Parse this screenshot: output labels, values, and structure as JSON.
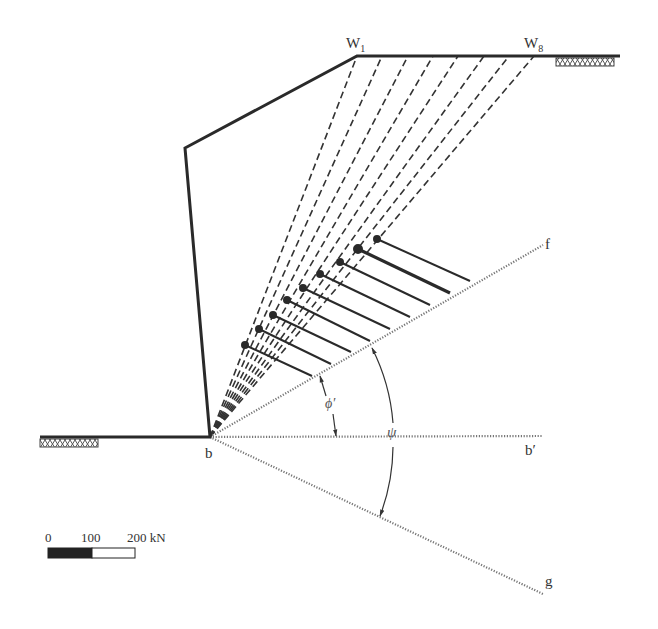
{
  "labels": {
    "w1": "W",
    "w1_sub": "1",
    "w8": "W",
    "w8_sub": "8",
    "b": "b",
    "b_prime": "b′",
    "f": "f",
    "g": "g",
    "phi": "ϕ′",
    "psi": "ψ"
  },
  "scale_bar": {
    "ticks": [
      "0",
      "100",
      "200 kN"
    ]
  },
  "colors": {
    "line": "#2a2a2a",
    "dotted": "#777777"
  },
  "geometry": {
    "toe_b": [
      210,
      437
    ],
    "crest_w1": [
      357,
      56
    ],
    "w8": [
      534,
      56
    ],
    "wall_top": [
      185,
      148
    ],
    "force_vectors": [
      {
        "start": [
          245,
          345
        ],
        "end": [
          312,
          376
        ]
      },
      {
        "start": [
          259,
          329
        ],
        "end": [
          331,
          364
        ]
      },
      {
        "start": [
          273,
          315
        ],
        "end": [
          351,
          352
        ]
      },
      {
        "start": [
          287,
          300
        ],
        "end": [
          370,
          341
        ]
      },
      {
        "start": [
          303,
          288
        ],
        "end": [
          390,
          329
        ]
      },
      {
        "start": [
          320,
          274
        ],
        "end": [
          410,
          317
        ]
      },
      {
        "start": [
          340,
          262
        ],
        "end": [
          430,
          305
        ]
      },
      {
        "start": [
          358,
          249
        ],
        "end": [
          450,
          293
        ]
      },
      {
        "start": [
          377,
          239
        ],
        "end": [
          470,
          281
        ]
      }
    ]
  }
}
